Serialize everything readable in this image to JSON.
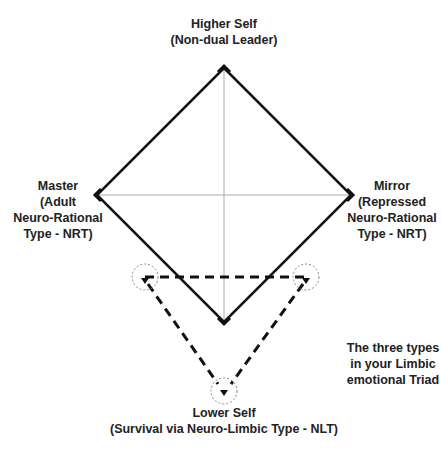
{
  "labels": {
    "top": {
      "line1": "Higher Self",
      "line2": "(Non-dual Leader)"
    },
    "left": {
      "line1": "Master",
      "line2": "(Adult",
      "line3": "Neuro-Rational",
      "line4": "Type - NRT)"
    },
    "right": {
      "line1": "Mirror",
      "line2": "(Repressed",
      "line3": "Neuro-Rational",
      "line4": "Type - NRT)"
    },
    "bottom": {
      "line1": "Lower Self",
      "line2": "(Survival via Neuro-Limbic Type - NLT)"
    },
    "note": {
      "line1": "The three types",
      "line2": "in your Limbic",
      "line3": "emotional Triad"
    }
  },
  "colors": {
    "line": "#111111",
    "axis": "#aaaaaa",
    "circle": "#888888"
  }
}
